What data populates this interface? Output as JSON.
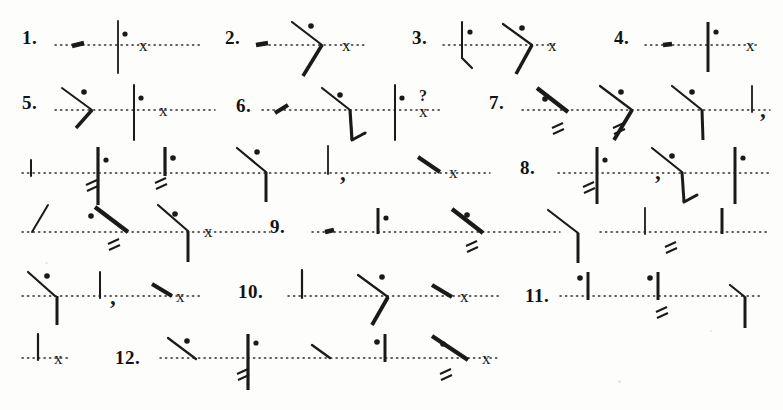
{
  "document": {
    "kind": "shorthand-exercise-sheet",
    "title": "Pitman shorthand reading exercise",
    "page_width": 783,
    "page_height": 410,
    "background_color": "#fdfdfc",
    "ink_color": "#1a1a1a",
    "baseline_style": "dotted"
  },
  "numbers": [
    {
      "id": "1",
      "label": "1.",
      "x": 22,
      "y": 28
    },
    {
      "id": "2",
      "label": "2.",
      "x": 225,
      "y": 28
    },
    {
      "id": "3",
      "label": "3.",
      "x": 412,
      "y": 28
    },
    {
      "id": "4",
      "label": "4.",
      "x": 614,
      "y": 28
    },
    {
      "id": "5",
      "label": "5.",
      "x": 22,
      "y": 93
    },
    {
      "id": "6",
      "label": "6.",
      "x": 236,
      "y": 96
    },
    {
      "id": "7",
      "label": "7.",
      "x": 489,
      "y": 93
    },
    {
      "id": "8",
      "label": "8.",
      "x": 520,
      "y": 158
    },
    {
      "id": "9",
      "label": "9.",
      "x": 270,
      "y": 217
    },
    {
      "id": "10",
      "label": "10.",
      "x": 238,
      "y": 282
    },
    {
      "id": "11",
      "label": "11.",
      "x": 525,
      "y": 286
    },
    {
      "id": "12",
      "label": "12.",
      "x": 115,
      "y": 348
    }
  ],
  "baselines": [
    {
      "id": "line-1",
      "x1": 55,
      "x2": 200,
      "y": 45
    },
    {
      "id": "line-2",
      "x1": 258,
      "x2": 365,
      "y": 45
    },
    {
      "id": "line-3",
      "x1": 443,
      "x2": 555,
      "y": 45
    },
    {
      "id": "line-4",
      "x1": 645,
      "x2": 760,
      "y": 45
    },
    {
      "id": "line-5",
      "x1": 55,
      "x2": 215,
      "y": 110
    },
    {
      "id": "line-6",
      "x1": 262,
      "x2": 440,
      "y": 110
    },
    {
      "id": "line-7",
      "x1": 522,
      "x2": 770,
      "y": 110
    },
    {
      "id": "line-8",
      "x1": 22,
      "x2": 490,
      "y": 173
    },
    {
      "id": "line-9",
      "x1": 558,
      "x2": 770,
      "y": 173
    },
    {
      "id": "line-10",
      "x1": 22,
      "x2": 270,
      "y": 232
    },
    {
      "id": "line-11",
      "x1": 312,
      "x2": 560,
      "y": 232
    },
    {
      "id": "line-12",
      "x1": 600,
      "x2": 770,
      "y": 232
    },
    {
      "id": "line-13",
      "x1": 22,
      "x2": 200,
      "y": 296
    },
    {
      "id": "line-14",
      "x1": 288,
      "x2": 500,
      "y": 296
    },
    {
      "id": "line-15",
      "x1": 560,
      "x2": 760,
      "y": 296
    },
    {
      "id": "line-16",
      "x1": 22,
      "x2": 70,
      "y": 358
    },
    {
      "id": "line-17",
      "x1": 160,
      "x2": 500,
      "y": 358
    }
  ],
  "strokes": [
    {
      "id": "s1-a",
      "item": "1",
      "type": "thick-short-slope",
      "x1": 72,
      "y1": 46,
      "x2": 84,
      "y2": 43,
      "w": 4.5
    },
    {
      "id": "s1-b",
      "item": "1",
      "type": "vertical-light",
      "x1": 118,
      "y1": 21,
      "x2": 118,
      "y2": 73,
      "w": 1.8
    },
    {
      "id": "s2-a",
      "item": "2",
      "type": "thick-blob",
      "x1": 256,
      "y1": 45,
      "x2": 268,
      "y2": 43,
      "w": 4.5
    },
    {
      "id": "s2-b",
      "item": "2",
      "type": "down-stroke",
      "x1": 292,
      "y1": 22,
      "x2": 322,
      "y2": 45,
      "w": 2.2
    },
    {
      "id": "s2-c",
      "item": "2",
      "type": "thick-up-stroke",
      "x1": 322,
      "y1": 45,
      "x2": 303,
      "y2": 76,
      "w": 3.6
    },
    {
      "id": "s3-a",
      "item": "3",
      "type": "vertical-light",
      "x1": 462,
      "y1": 22,
      "x2": 462,
      "y2": 58,
      "w": 2.0
    },
    {
      "id": "s3-b",
      "item": "3",
      "type": "hook",
      "x1": 462,
      "y1": 58,
      "x2": 472,
      "y2": 68,
      "w": 2.2
    },
    {
      "id": "s3-c",
      "item": "3",
      "type": "down-stroke",
      "x1": 503,
      "y1": 24,
      "x2": 532,
      "y2": 45,
      "w": 2.2
    },
    {
      "id": "s3-d",
      "item": "3",
      "type": "thick-up-stroke",
      "x1": 532,
      "y1": 45,
      "x2": 516,
      "y2": 74,
      "w": 3.6
    },
    {
      "id": "s4-a",
      "item": "4",
      "type": "thick-blob",
      "x1": 663,
      "y1": 45,
      "x2": 672,
      "y2": 44,
      "w": 4.5
    },
    {
      "id": "s4-b",
      "item": "4",
      "type": "vertical-heavy",
      "x1": 708,
      "y1": 22,
      "x2": 708,
      "y2": 72,
      "w": 3.0
    },
    {
      "id": "s5-a",
      "item": "5",
      "type": "down-stroke",
      "x1": 62,
      "y1": 88,
      "x2": 92,
      "y2": 110,
      "w": 2.0
    },
    {
      "id": "s5-b",
      "item": "5",
      "type": "thick-up-stroke",
      "x1": 92,
      "y1": 110,
      "x2": 76,
      "y2": 128,
      "w": 3.4
    },
    {
      "id": "s5-c",
      "item": "5",
      "type": "vertical-light",
      "x1": 134,
      "y1": 85,
      "x2": 134,
      "y2": 140,
      "w": 2.0
    },
    {
      "id": "s6-a",
      "item": "6",
      "type": "thick-short-slope",
      "x1": 275,
      "y1": 113,
      "x2": 288,
      "y2": 105,
      "w": 4.0
    },
    {
      "id": "s6-b",
      "item": "6",
      "type": "down-stroke",
      "x1": 322,
      "y1": 88,
      "x2": 350,
      "y2": 110,
      "w": 2.2
    },
    {
      "id": "s6-c",
      "item": "6",
      "type": "vertical-heavy",
      "x1": 350,
      "y1": 110,
      "x2": 352,
      "y2": 140,
      "w": 3.2
    },
    {
      "id": "s6-d",
      "item": "6",
      "type": "hook",
      "x1": 352,
      "y1": 140,
      "x2": 365,
      "y2": 133,
      "w": 3.0
    },
    {
      "id": "s6-e",
      "item": "6",
      "type": "vertical-light",
      "x1": 395,
      "y1": 85,
      "x2": 395,
      "y2": 140,
      "w": 2.0
    },
    {
      "id": "s7-a",
      "item": "7",
      "type": "thick-down-stroke",
      "x1": 537,
      "y1": 88,
      "x2": 568,
      "y2": 112,
      "w": 4.2
    },
    {
      "id": "s7-b",
      "item": "7",
      "type": "down-stroke",
      "x1": 600,
      "y1": 86,
      "x2": 632,
      "y2": 110,
      "w": 2.2
    },
    {
      "id": "s7-c",
      "item": "7",
      "type": "thick-up-stroke",
      "x1": 632,
      "y1": 110,
      "x2": 614,
      "y2": 140,
      "w": 3.8
    },
    {
      "id": "s7-d",
      "item": "7",
      "type": "down-stroke",
      "x1": 672,
      "y1": 86,
      "x2": 702,
      "y2": 110,
      "w": 2.2
    },
    {
      "id": "s7-e",
      "item": "7",
      "type": "vertical-heavy",
      "x1": 702,
      "y1": 110,
      "x2": 703,
      "y2": 140,
      "w": 3.0
    },
    {
      "id": "s7-f",
      "item": "7",
      "type": "vertical-light",
      "x1": 752,
      "y1": 86,
      "x2": 752,
      "y2": 112,
      "w": 1.8
    },
    {
      "id": "s8-a",
      "item": "r3",
      "type": "vertical-light",
      "x1": 31,
      "y1": 160,
      "x2": 31,
      "y2": 176,
      "w": 2.0
    },
    {
      "id": "s8-b",
      "item": "r3",
      "type": "vertical-heavy",
      "x1": 98,
      "y1": 147,
      "x2": 98,
      "y2": 205,
      "w": 3.2
    },
    {
      "id": "s8-c",
      "item": "r3",
      "type": "vertical-heavy",
      "x1": 165,
      "y1": 147,
      "x2": 165,
      "y2": 176,
      "w": 3.2
    },
    {
      "id": "s8-d",
      "item": "r3",
      "type": "down-stroke",
      "x1": 237,
      "y1": 148,
      "x2": 266,
      "y2": 172,
      "w": 2.2
    },
    {
      "id": "s8-e",
      "item": "r3",
      "type": "vertical-heavy",
      "x1": 266,
      "y1": 172,
      "x2": 266,
      "y2": 202,
      "w": 3.0
    },
    {
      "id": "s8-f",
      "item": "r3",
      "type": "vertical-light",
      "x1": 328,
      "y1": 146,
      "x2": 328,
      "y2": 174,
      "w": 1.8
    },
    {
      "id": "s8-g",
      "item": "r3",
      "type": "thick-down-stroke",
      "x1": 418,
      "y1": 157,
      "x2": 440,
      "y2": 172,
      "w": 4.0
    },
    {
      "id": "s9-a",
      "item": "8",
      "type": "vertical-heavy",
      "x1": 597,
      "y1": 147,
      "x2": 597,
      "y2": 204,
      "w": 3.0
    },
    {
      "id": "s9-b",
      "item": "8",
      "type": "down-stroke",
      "x1": 652,
      "y1": 148,
      "x2": 682,
      "y2": 172,
      "w": 2.2
    },
    {
      "id": "s9-c",
      "item": "8",
      "type": "vertical-heavy",
      "x1": 682,
      "y1": 172,
      "x2": 684,
      "y2": 202,
      "w": 3.0
    },
    {
      "id": "s9-d",
      "item": "8",
      "type": "hook",
      "x1": 684,
      "y1": 202,
      "x2": 697,
      "y2": 195,
      "w": 3.0
    },
    {
      "id": "s9-e",
      "item": "8",
      "type": "vertical-heavy",
      "x1": 735,
      "y1": 147,
      "x2": 735,
      "y2": 204,
      "w": 3.0
    },
    {
      "id": "s10-a",
      "item": "r4",
      "type": "up-stroke",
      "x1": 32,
      "y1": 232,
      "x2": 48,
      "y2": 205,
      "w": 2.0
    },
    {
      "id": "s10-b",
      "item": "r4",
      "type": "thick-down-stroke",
      "x1": 95,
      "y1": 207,
      "x2": 128,
      "y2": 232,
      "w": 4.2
    },
    {
      "id": "s10-c",
      "item": "r4",
      "type": "down-stroke",
      "x1": 158,
      "y1": 205,
      "x2": 188,
      "y2": 231,
      "w": 2.2
    },
    {
      "id": "s10-d",
      "item": "r4",
      "type": "vertical-heavy",
      "x1": 188,
      "y1": 231,
      "x2": 188,
      "y2": 262,
      "w": 3.0
    },
    {
      "id": "s11-a",
      "item": "9",
      "type": "thick-blob",
      "x1": 325,
      "y1": 232,
      "x2": 334,
      "y2": 230,
      "w": 4.5
    },
    {
      "id": "s11-b",
      "item": "9",
      "type": "vertical-heavy",
      "x1": 378,
      "y1": 208,
      "x2": 378,
      "y2": 234,
      "w": 3.0
    },
    {
      "id": "s11-c",
      "item": "9",
      "type": "thick-down-stroke",
      "x1": 452,
      "y1": 209,
      "x2": 483,
      "y2": 233,
      "w": 4.2
    },
    {
      "id": "s11-d",
      "item": "9",
      "type": "down-stroke",
      "x1": 548,
      "y1": 210,
      "x2": 578,
      "y2": 233,
      "w": 2.2
    },
    {
      "id": "s11-e",
      "item": "9",
      "type": "vertical-heavy",
      "x1": 578,
      "y1": 233,
      "x2": 578,
      "y2": 263,
      "w": 3.0
    },
    {
      "id": "s11-f",
      "item": "9",
      "type": "vertical-light",
      "x1": 645,
      "y1": 208,
      "x2": 645,
      "y2": 234,
      "w": 1.8
    },
    {
      "id": "s11-g",
      "item": "9",
      "type": "vertical-heavy",
      "x1": 722,
      "y1": 208,
      "x2": 722,
      "y2": 234,
      "w": 3.0
    },
    {
      "id": "s12-a",
      "item": "r5",
      "type": "down-stroke",
      "x1": 28,
      "y1": 272,
      "x2": 55,
      "y2": 296,
      "w": 2.2
    },
    {
      "id": "s12-b",
      "item": "r5",
      "type": "vertical-heavy",
      "x1": 57,
      "y1": 296,
      "x2": 57,
      "y2": 325,
      "w": 3.0
    },
    {
      "id": "s12-c",
      "item": "r5",
      "type": "vertical-light",
      "x1": 100,
      "y1": 272,
      "x2": 100,
      "y2": 298,
      "w": 2.0
    },
    {
      "id": "s12-d",
      "item": "r5",
      "type": "thick-down-stroke",
      "x1": 152,
      "y1": 284,
      "x2": 172,
      "y2": 296,
      "w": 4.0
    },
    {
      "id": "s13-a",
      "item": "10",
      "type": "vertical-light",
      "x1": 302,
      "y1": 270,
      "x2": 302,
      "y2": 298,
      "w": 2.2
    },
    {
      "id": "s13-b",
      "item": "10",
      "type": "down-stroke",
      "x1": 358,
      "y1": 275,
      "x2": 388,
      "y2": 297,
      "w": 2.2
    },
    {
      "id": "s13-c",
      "item": "10",
      "type": "thick-up-stroke",
      "x1": 388,
      "y1": 297,
      "x2": 372,
      "y2": 325,
      "w": 3.8
    },
    {
      "id": "s13-d",
      "item": "10",
      "type": "thick-down-stroke",
      "x1": 432,
      "y1": 285,
      "x2": 452,
      "y2": 297,
      "w": 4.2
    },
    {
      "id": "s14-a",
      "item": "11",
      "type": "vertical-heavy",
      "x1": 588,
      "y1": 272,
      "x2": 588,
      "y2": 300,
      "w": 3.0
    },
    {
      "id": "s14-b",
      "item": "11",
      "type": "vertical-heavy",
      "x1": 658,
      "y1": 272,
      "x2": 658,
      "y2": 300,
      "w": 3.0
    },
    {
      "id": "s14-c",
      "item": "11",
      "type": "down-stroke",
      "x1": 730,
      "y1": 285,
      "x2": 745,
      "y2": 297,
      "w": 2.2
    },
    {
      "id": "s14-d",
      "item": "11",
      "type": "vertical-heavy",
      "x1": 745,
      "y1": 297,
      "x2": 745,
      "y2": 328,
      "w": 3.0
    },
    {
      "id": "s15-a",
      "item": "r6",
      "type": "vertical-light",
      "x1": 38,
      "y1": 334,
      "x2": 38,
      "y2": 360,
      "w": 2.2
    },
    {
      "id": "s16-a",
      "item": "12",
      "type": "down-stroke",
      "x1": 168,
      "y1": 338,
      "x2": 196,
      "y2": 359,
      "w": 2.2
    },
    {
      "id": "s16-b",
      "item": "12",
      "type": "vertical-heavy",
      "x1": 248,
      "y1": 334,
      "x2": 248,
      "y2": 390,
      "w": 3.2
    },
    {
      "id": "s16-c",
      "item": "12",
      "type": "down-stroke",
      "x1": 312,
      "y1": 345,
      "x2": 330,
      "y2": 358,
      "w": 2.4
    },
    {
      "id": "s16-d",
      "item": "12",
      "type": "vertical-heavy",
      "x1": 385,
      "y1": 334,
      "x2": 385,
      "y2": 362,
      "w": 3.0
    },
    {
      "id": "s16-e",
      "item": "12",
      "type": "thick-down-stroke",
      "x1": 432,
      "y1": 336,
      "x2": 468,
      "y2": 360,
      "w": 4.2
    }
  ],
  "dots": [
    {
      "id": "d1",
      "x": 125,
      "y": 34,
      "r": 2.6
    },
    {
      "id": "d2",
      "x": 311,
      "y": 26,
      "r": 2.8
    },
    {
      "id": "d3",
      "x": 470,
      "y": 32,
      "r": 2.6
    },
    {
      "id": "d4",
      "x": 522,
      "y": 28,
      "r": 2.8
    },
    {
      "id": "d5",
      "x": 716,
      "y": 32,
      "r": 2.6
    },
    {
      "id": "d6",
      "x": 84,
      "y": 92,
      "r": 2.8
    },
    {
      "id": "d7",
      "x": 141,
      "y": 98,
      "r": 2.6
    },
    {
      "id": "d8",
      "x": 340,
      "y": 95,
      "r": 2.8
    },
    {
      "id": "d9",
      "x": 402,
      "y": 98,
      "r": 2.6
    },
    {
      "id": "d10",
      "x": 545,
      "y": 99,
      "r": 2.8
    },
    {
      "id": "d11",
      "x": 621,
      "y": 92,
      "r": 2.8
    },
    {
      "id": "d12",
      "x": 692,
      "y": 92,
      "r": 2.8
    },
    {
      "id": "d13",
      "x": 106,
      "y": 160,
      "r": 2.6
    },
    {
      "id": "d14",
      "x": 173,
      "y": 158,
      "r": 2.8
    },
    {
      "id": "d15",
      "x": 257,
      "y": 152,
      "r": 2.8
    },
    {
      "id": "d16",
      "x": 605,
      "y": 160,
      "r": 2.6
    },
    {
      "id": "d17",
      "x": 672,
      "y": 156,
      "r": 2.8
    },
    {
      "id": "d18",
      "x": 743,
      "y": 158,
      "r": 2.6
    },
    {
      "id": "d19",
      "x": 91,
      "y": 216,
      "r": 2.8
    },
    {
      "id": "d20",
      "x": 175,
      "y": 214,
      "r": 2.8
    },
    {
      "id": "d21",
      "x": 467,
      "y": 215,
      "r": 2.8
    },
    {
      "id": "d22",
      "x": 386,
      "y": 218,
      "r": 2.6
    },
    {
      "id": "d23",
      "x": 47,
      "y": 276,
      "r": 2.8
    },
    {
      "id": "d24",
      "x": 382,
      "y": 277,
      "r": 2.8
    },
    {
      "id": "d25",
      "x": 580,
      "y": 278,
      "r": 2.8
    },
    {
      "id": "d26",
      "x": 650,
      "y": 278,
      "r": 2.8
    },
    {
      "id": "d27",
      "x": 187,
      "y": 341,
      "r": 2.8
    },
    {
      "id": "d28",
      "x": 256,
      "y": 343,
      "r": 2.6
    },
    {
      "id": "d29",
      "x": 377,
      "y": 342,
      "r": 2.8
    },
    {
      "id": "d30",
      "x": 443,
      "y": 344,
      "r": 2.8
    }
  ],
  "double_dashes": [
    {
      "id": "dd1",
      "x": 86,
      "y": 185
    },
    {
      "id": "dd2",
      "x": 155,
      "y": 183
    },
    {
      "id": "dd3",
      "x": 108,
      "y": 244
    },
    {
      "id": "dd4",
      "x": 552,
      "y": 128
    },
    {
      "id": "dd5",
      "x": 613,
      "y": 128
    },
    {
      "id": "dd6",
      "x": 583,
      "y": 187
    },
    {
      "id": "dd7",
      "x": 466,
      "y": 246
    },
    {
      "id": "dd8",
      "x": 665,
      "y": 247
    },
    {
      "id": "dd9",
      "x": 656,
      "y": 312
    },
    {
      "id": "dd10",
      "x": 237,
      "y": 374
    },
    {
      "id": "dd11",
      "x": 440,
      "y": 374
    }
  ],
  "punctuation": [
    {
      "id": "p1",
      "glyph": "x",
      "kind": "full-stop",
      "x": 139,
      "y": 37
    },
    {
      "id": "p2",
      "glyph": "x",
      "kind": "full-stop",
      "x": 342,
      "y": 37
    },
    {
      "id": "p3",
      "glyph": "x",
      "kind": "full-stop",
      "x": 548,
      "y": 37
    },
    {
      "id": "p4",
      "glyph": "x",
      "kind": "full-stop",
      "x": 746,
      "y": 37
    },
    {
      "id": "p5",
      "glyph": "x",
      "kind": "full-stop",
      "x": 159,
      "y": 102
    },
    {
      "id": "p6",
      "glyph": "?",
      "kind": "question-mark",
      "x": 419,
      "y": 88
    },
    {
      "id": "p7",
      "glyph": "x",
      "kind": "full-stop",
      "x": 419,
      "y": 103
    },
    {
      "id": "p8",
      "glyph": ",",
      "kind": "comma",
      "x": 760,
      "y": 98
    },
    {
      "id": "p9",
      "glyph": ",",
      "kind": "comma",
      "x": 340,
      "y": 161
    },
    {
      "id": "p10",
      "glyph": "x",
      "kind": "full-stop",
      "x": 449,
      "y": 164
    },
    {
      "id": "p11",
      "glyph": "x",
      "kind": "full-stop",
      "x": 204,
      "y": 223
    },
    {
      "id": "p12",
      "glyph": ",",
      "kind": "comma",
      "x": 110,
      "y": 285
    },
    {
      "id": "p13",
      "glyph": "x",
      "kind": "full-stop",
      "x": 176,
      "y": 288
    },
    {
      "id": "p14",
      "glyph": "x",
      "kind": "full-stop",
      "x": 460,
      "y": 288
    },
    {
      "id": "p15",
      "glyph": "x",
      "kind": "full-stop",
      "x": 54,
      "y": 350
    },
    {
      "id": "p16",
      "glyph": "x",
      "kind": "full-stop",
      "x": 482,
      "y": 350
    },
    {
      "id": "p17",
      "glyph": ",",
      "kind": "comma",
      "x": 655,
      "y": 160
    }
  ],
  "specks": [
    {
      "id": "sp1",
      "x": 618,
      "y": 380,
      "w": 3,
      "h": 3
    },
    {
      "id": "sp2",
      "x": 45,
      "y": 262,
      "w": 3,
      "h": 2
    },
    {
      "id": "sp3",
      "x": 710,
      "y": 330,
      "w": 2,
      "h": 2
    }
  ]
}
